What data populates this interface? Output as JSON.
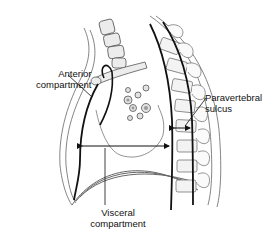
{
  "figure": {
    "line_color": "#111111",
    "outline_color": "#555555",
    "fill_color": "#e6e6e6"
  },
  "labels": {
    "anterior": {
      "line1": "Anterior",
      "line2": "compartment"
    },
    "paravertebral": {
      "line1": "Paravertebral",
      "line2": "sulcus"
    },
    "visceral": {
      "line1": "Visceral",
      "line2": "compartment"
    }
  }
}
